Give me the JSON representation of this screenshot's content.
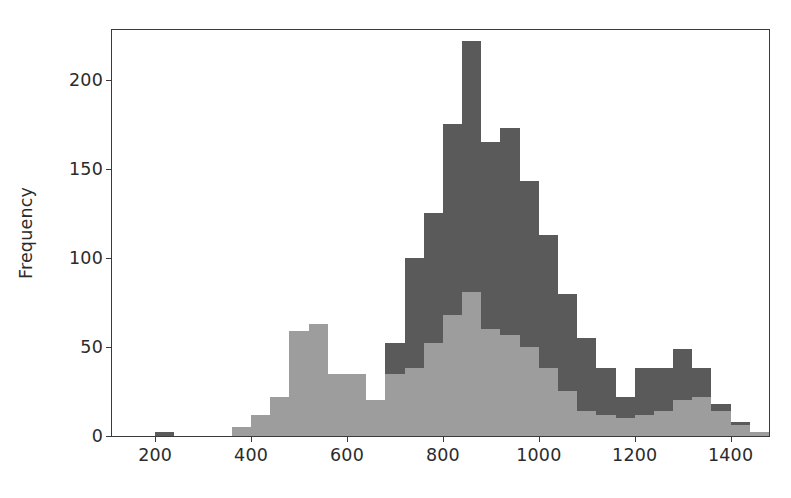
{
  "chart_data": {
    "type": "bar",
    "subtype": "histogram-overlay",
    "title": "",
    "xlabel": "",
    "ylabel": "Frequency",
    "xlim": [
      110,
      1480
    ],
    "ylim": [
      0,
      228
    ],
    "grid": false,
    "legend": null,
    "bin_width": 40,
    "xticks": [
      200,
      400,
      600,
      800,
      1000,
      1200,
      1400
    ],
    "xtick_labels": [
      "200",
      "400",
      "600",
      "800",
      "1000",
      "1200",
      "1400"
    ],
    "yticks": [
      0,
      50,
      100,
      150,
      200
    ],
    "ytick_labels": [
      "0",
      "50",
      "100",
      "150",
      "200"
    ],
    "colors": {
      "series_dark": "#5a5a5a",
      "series_light": "#9d9d9d",
      "axis": "#3a3a3a",
      "background": "#ffffff",
      "text": "#2b2b2b"
    },
    "bin_starts": [
      200,
      240,
      280,
      320,
      360,
      400,
      440,
      480,
      520,
      560,
      600,
      640,
      680,
      720,
      760,
      800,
      840,
      880,
      920,
      960,
      1000,
      1040,
      1080,
      1120,
      1160,
      1200,
      1240,
      1280,
      1320,
      1360,
      1400,
      1440
    ],
    "series": [
      {
        "name": "dark",
        "color": "#5a5a5a",
        "values": [
          2,
          0,
          0,
          0,
          5,
          12,
          22,
          22,
          14,
          35,
          35,
          20,
          52,
          100,
          125,
          175,
          222,
          165,
          173,
          143,
          113,
          80,
          55,
          38,
          22,
          38,
          38,
          49,
          38,
          18,
          8,
          2
        ]
      },
      {
        "name": "light",
        "color": "#9d9d9d",
        "values": [
          0,
          0,
          0,
          0,
          5,
          12,
          22,
          59,
          63,
          35,
          35,
          20,
          35,
          38,
          52,
          68,
          81,
          60,
          57,
          50,
          38,
          25,
          14,
          12,
          10,
          12,
          14,
          20,
          22,
          14,
          6,
          2
        ]
      }
    ]
  }
}
